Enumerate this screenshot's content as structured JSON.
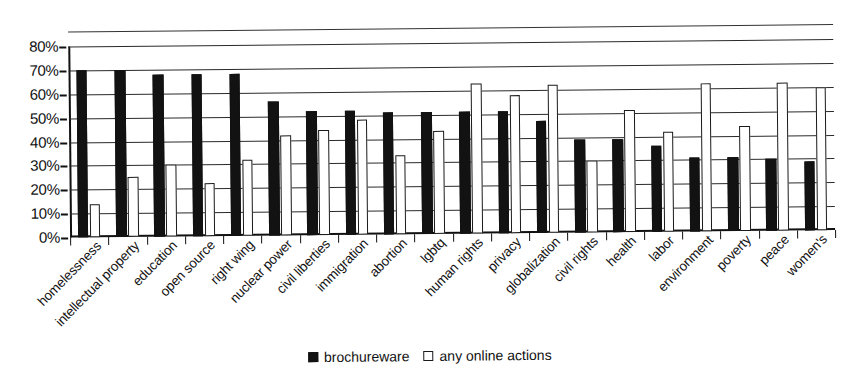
{
  "chart_data": {
    "type": "bar",
    "title": "",
    "subtitle": "",
    "xlabel": "",
    "ylabel": "",
    "ylim": [
      0,
      80
    ],
    "ytick_values": [
      0,
      10,
      20,
      30,
      40,
      50,
      60,
      70,
      80
    ],
    "ytick_labels": [
      "0%",
      "10%",
      "20%",
      "30%",
      "40%",
      "50%",
      "60%",
      "70%",
      "80%"
    ],
    "grid": true,
    "legend_position": "bottom-center",
    "categories": [
      "homelessness",
      "intellectual property",
      "education",
      "open source",
      "right wing",
      "nuclear power",
      "civil liberties",
      "immigration",
      "abortion",
      "lgbtq",
      "human rights",
      "privacy",
      "globalization",
      "civil rights",
      "health",
      "labor",
      "environment",
      "poverty",
      "peace",
      "women's"
    ],
    "series": [
      {
        "name": "brochureware",
        "color": "#121212",
        "style": "filled",
        "values": [
          70,
          70,
          68,
          68,
          68,
          56,
          52,
          52,
          51,
          51,
          51,
          51,
          47,
          39,
          39,
          36,
          31,
          31,
          30,
          29
        ]
      },
      {
        "name": "any online actions",
        "color": "#ffffff",
        "style": "open",
        "values": [
          14,
          25,
          30,
          22,
          32,
          42,
          44,
          48,
          33,
          43,
          63,
          58,
          62,
          30,
          51,
          42,
          62,
          44,
          62,
          60
        ]
      }
    ]
  },
  "legend": {
    "items": [
      {
        "label": "brochureware",
        "swatch": "filled-square"
      },
      {
        "label": "any online actions",
        "swatch": "open-square"
      }
    ]
  }
}
